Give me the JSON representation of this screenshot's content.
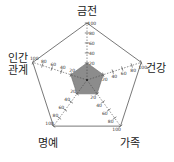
{
  "chart_data": {
    "type": "radar",
    "title": "",
    "axes": [
      "금전",
      "건강",
      "가족",
      "명예",
      "인간 관계"
    ],
    "ticks": [
      20,
      40,
      60,
      80,
      100
    ],
    "range": [
      0,
      100
    ],
    "series": [
      {
        "name": "",
        "values": [
          20,
          20,
          20,
          20,
          20
        ],
        "color": "#8c8c8c"
      }
    ],
    "grid": false,
    "legend": "none"
  },
  "labels": {
    "top": "금전",
    "right": "건강",
    "bottom_right": "가족",
    "bottom_left": "명예",
    "left_line1": "인간",
    "left_line2": "관계"
  },
  "colors": {
    "fill": "#8c8c8c",
    "outline": "#555555",
    "axis": "#444444"
  }
}
